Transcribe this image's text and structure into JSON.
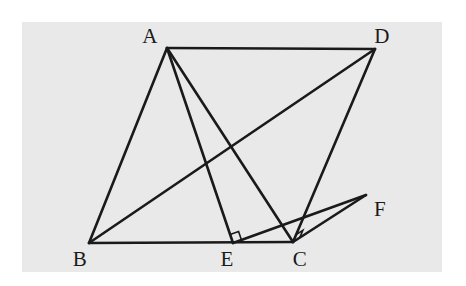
{
  "figure": {
    "type": "geometry-diagram",
    "canvas": {
      "width": 466,
      "height": 286
    },
    "panel": {
      "x": 22,
      "y": 22,
      "width": 420,
      "height": 250,
      "fill": "#e9e9e9"
    },
    "page_background": "#ffffff",
    "stroke_color": "#1a1a1a",
    "stroke_width": 2.6,
    "label_color": "#1a1a1a",
    "label_font_size": 21
  },
  "points": {
    "A": {
      "name": "A",
      "x": 167,
      "y": 48,
      "label_x": 150,
      "label_y": 36
    },
    "B": {
      "name": "B",
      "x": 89,
      "y": 243,
      "label_x": 80,
      "label_y": 259
    },
    "C": {
      "name": "C",
      "x": 293,
      "y": 242,
      "label_x": 300,
      "label_y": 259
    },
    "D": {
      "name": "D",
      "x": 375,
      "y": 49,
      "label_x": 382,
      "label_y": 36
    },
    "E": {
      "name": "E",
      "x": 233,
      "y": 243,
      "label_x": 227,
      "label_y": 259
    },
    "F": {
      "name": "F",
      "x": 366,
      "y": 195,
      "label_x": 380,
      "label_y": 209
    }
  },
  "segments": [
    {
      "id": "AD",
      "name": "segment-ad",
      "from": "A",
      "to": "D"
    },
    {
      "id": "AB",
      "name": "segment-ab",
      "from": "A",
      "to": "B"
    },
    {
      "id": "BC",
      "name": "segment-bc",
      "from": "B",
      "to": "C"
    },
    {
      "id": "DC",
      "name": "segment-dc",
      "from": "D",
      "to": "C"
    },
    {
      "id": "BD",
      "name": "segment-bd-diagonal",
      "from": "B",
      "to": "D"
    },
    {
      "id": "AE",
      "name": "segment-ae-altitude",
      "from": "A",
      "to": "E"
    },
    {
      "id": "AC",
      "name": "segment-ac-diagonal",
      "from": "A",
      "to": "C"
    },
    {
      "id": "EF",
      "name": "segment-ef",
      "from": "E",
      "to": "F"
    },
    {
      "id": "CF",
      "name": "segment-cf",
      "from": "C",
      "to": "F"
    }
  ],
  "right_angles": [
    {
      "id": "angle-at-e",
      "name": "right-angle-mark-e",
      "vertex": "E",
      "ray1": "A",
      "ray2": "F",
      "size": 9
    },
    {
      "id": "angle-at-c",
      "name": "right-angle-mark-c",
      "vertex": "C",
      "ray1": "D",
      "ray2": "F",
      "size": 8
    }
  ],
  "labels": [
    {
      "key": "A",
      "text": "A"
    },
    {
      "key": "B",
      "text": "B"
    },
    {
      "key": "C",
      "text": "C"
    },
    {
      "key": "D",
      "text": "D"
    },
    {
      "key": "E",
      "text": "E"
    },
    {
      "key": "F",
      "text": "F"
    }
  ]
}
